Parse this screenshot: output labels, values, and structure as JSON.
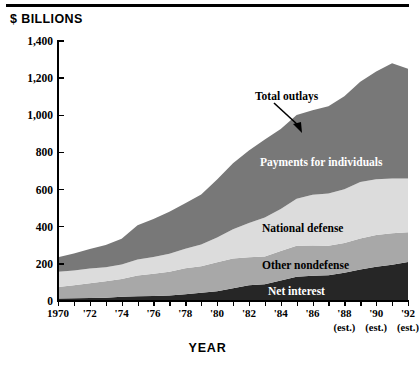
{
  "figure": {
    "y_axis_title": "$ BILLIONS",
    "x_axis_title": "YEAR"
  },
  "labels": {
    "total_outlays": "Total outlays",
    "payments": "Payments for individuals",
    "defense": "National defense",
    "nondefense": "Other nondefense",
    "net_interest": "Net interest"
  },
  "colors": {
    "payments": "#787878",
    "defense": "#dcdcdc",
    "nondefense": "#a8a8a8",
    "net_interest": "#262626",
    "axis": "#000000",
    "background": "#ffffff"
  },
  "y_ticks": [
    "0",
    "200",
    "400",
    "600",
    "800",
    "1,000",
    "1,200",
    "1,400"
  ],
  "x_ticks": [
    {
      "label": "1970",
      "est": ""
    },
    {
      "label": "'72",
      "est": ""
    },
    {
      "label": "'74",
      "est": ""
    },
    {
      "label": "'76",
      "est": ""
    },
    {
      "label": "'78",
      "est": ""
    },
    {
      "label": "'80",
      "est": ""
    },
    {
      "label": "'82",
      "est": ""
    },
    {
      "label": "'84",
      "est": ""
    },
    {
      "label": "'86",
      "est": ""
    },
    {
      "label": "'88",
      "est": "(est.)"
    },
    {
      "label": "'90",
      "est": "(est.)"
    },
    {
      "label": "'92",
      "est": "(est.)"
    }
  ],
  "chart_data": {
    "type": "area",
    "title": "",
    "xlabel": "YEAR",
    "ylabel": "$ BILLIONS",
    "ylim": [
      0,
      1400
    ],
    "xlim": [
      1970,
      1992
    ],
    "ytick_step": 200,
    "grid": false,
    "legend": "inline-labels",
    "stacked": true,
    "annotation": "Total outlays",
    "x": [
      1970,
      1971,
      1972,
      1973,
      1974,
      1975,
      1976,
      1977,
      1978,
      1979,
      1980,
      1981,
      1982,
      1983,
      1984,
      1985,
      1986,
      1987,
      1988,
      1989,
      1990,
      1991,
      1992
    ],
    "series": [
      {
        "name": "Net interest",
        "color": "#262626",
        "values": [
          14,
          15,
          16,
          18,
          23,
          25,
          27,
          30,
          36,
          44,
          53,
          69,
          85,
          90,
          111,
          130,
          136,
          139,
          152,
          169,
          184,
          195,
          210
        ]
      },
      {
        "name": "Other nondefense",
        "color": "#a8a8a8",
        "values": [
          62,
          70,
          80,
          88,
          95,
          112,
          120,
          128,
          140,
          143,
          155,
          160,
          150,
          150,
          158,
          168,
          163,
          158,
          160,
          168,
          172,
          170,
          160
        ]
      },
      {
        "name": "National defense",
        "color": "#dcdcdc",
        "values": [
          82,
          79,
          79,
          76,
          79,
          86,
          90,
          97,
          105,
          117,
          134,
          158,
          185,
          210,
          227,
          253,
          273,
          282,
          290,
          304,
          300,
          295,
          290
        ]
      },
      {
        "name": "Payments for individuals",
        "color": "#787878",
        "values": [
          78,
          92,
          105,
          120,
          138,
          185,
          205,
          225,
          245,
          270,
          312,
          355,
          390,
          420,
          430,
          450,
          455,
          470,
          500,
          540,
          580,
          620,
          590
        ]
      }
    ],
    "totals": [
      236,
      256,
      280,
      302,
      335,
      408,
      442,
      480,
      526,
      574,
      654,
      742,
      810,
      870,
      926,
      1001,
      1027,
      1049,
      1102,
      1181,
      1236,
      1280,
      1250
    ]
  }
}
